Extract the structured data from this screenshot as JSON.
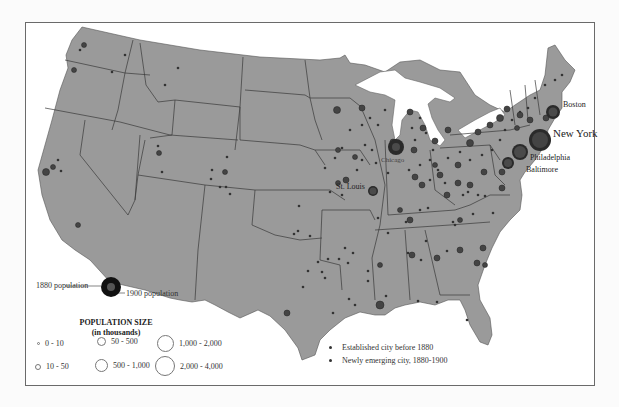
{
  "map": {
    "title": "Urbanization of the United States, 1880-1900",
    "colors": {
      "land": "#9a9a9a",
      "border": "#3a3a3a",
      "water": "#ffffff",
      "city_1880": "#555555",
      "city_1900": "#2a2a2a"
    },
    "major_cities": [
      {
        "name": "Boston",
        "x": 553,
        "y": 104,
        "r": 7,
        "label_x": 563,
        "label_y": 100,
        "size": "small"
      },
      {
        "name": "New York",
        "x": 540,
        "y": 140,
        "r": 11,
        "label_x": 553,
        "label_y": 127,
        "size": "big"
      },
      {
        "name": "Philadelphia",
        "x": 519,
        "y": 152,
        "r": 8,
        "label_x": 530,
        "label_y": 153,
        "size": "small"
      },
      {
        "name": "Baltimore",
        "x": 508,
        "y": 164,
        "r": 6,
        "label_x": 527,
        "label_y": 165,
        "size": "small"
      },
      {
        "name": "Chicago",
        "x": 396,
        "y": 147,
        "r": 8,
        "label_x": 382,
        "label_y": 156,
        "size": "small"
      },
      {
        "name": "St. Louis",
        "x": 373,
        "y": 191,
        "r": 5,
        "label_x": 336,
        "label_y": 183,
        "size": "small"
      }
    ]
  },
  "legend": {
    "pop_marker": {
      "label_1880": "1880 population",
      "label_1900": "1900 population"
    },
    "population_size": {
      "title": "POPULATION SIZE",
      "subtitle": "(in thousands)",
      "items": [
        {
          "label": "0 - 10",
          "d": 3
        },
        {
          "label": "10 - 50",
          "d": 6
        },
        {
          "label": "50 - 500",
          "d": 12
        },
        {
          "label": "500 - 1,000",
          "d": 16
        },
        {
          "label": "1,000 - 2,000",
          "d": 20
        },
        {
          "label": "2,000 - 4,000",
          "d": 24
        }
      ]
    },
    "city_type": {
      "items": [
        {
          "label": "Established city before 1880"
        },
        {
          "label": "Newly emerging city, 1880-1900"
        }
      ]
    }
  }
}
